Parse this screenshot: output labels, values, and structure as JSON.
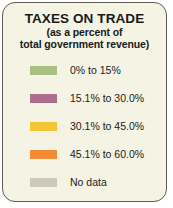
{
  "legend": {
    "title": "TAXES ON TRADE",
    "subtitle_line1": "(as a percent of",
    "subtitle_line2": "total government revenue)",
    "background_color": "#f4f3e4",
    "border_color": "#5e5e52",
    "text_color": "#1a1a1a",
    "entries": [
      {
        "label": "0% to 15%",
        "color": "#a8c183"
      },
      {
        "label": "15.1% to 30.0%",
        "color": "#ad6e90"
      },
      {
        "label": "30.1% to 45.0%",
        "color": "#f7c534"
      },
      {
        "label": "45.1% to 60.0%",
        "color": "#f28b33"
      },
      {
        "label": "No data",
        "color": "#cdc9bb"
      }
    ]
  }
}
